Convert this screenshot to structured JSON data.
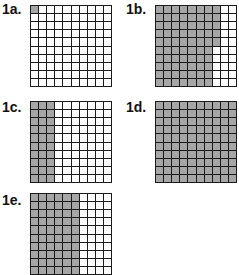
{
  "colors": {
    "shaded": "#a6a6a6",
    "unshaded": "#ffffff",
    "line": "#1a1a1a"
  },
  "figures": [
    {
      "id": "1a",
      "label": "1a.",
      "rows": 10,
      "cols": 10,
      "shaded_cells": 1,
      "shading": "top-left single cell"
    },
    {
      "id": "1b",
      "label": "1b.",
      "rows": 10,
      "cols": 10,
      "shaded_cells": 75,
      "shading": "7 full columns + top 5 cells of column 8"
    },
    {
      "id": "1c",
      "label": "1c.",
      "rows": 10,
      "cols": 10,
      "shaded_cells": 30,
      "shading": "3 full columns"
    },
    {
      "id": "1d",
      "label": "1d.",
      "rows": 10,
      "cols": 10,
      "shaded_cells": 100,
      "shading": "all cells"
    },
    {
      "id": "1e",
      "label": "1e.",
      "rows": 10,
      "cols": 10,
      "shaded_cells": 60,
      "shading": "6 full columns"
    }
  ]
}
